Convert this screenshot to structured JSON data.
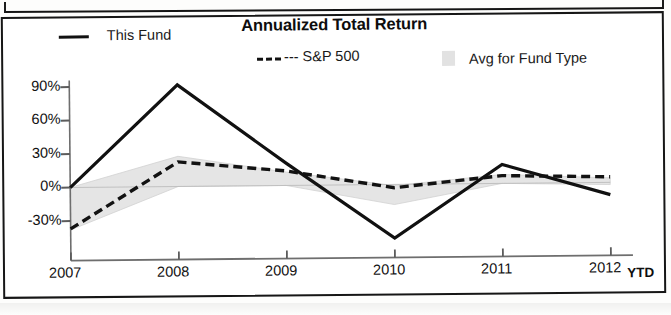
{
  "chart_data": {
    "type": "line",
    "title": "Annualized Total Return",
    "xlabel": "",
    "ylabel": "",
    "x_axis_suffix": "YTD",
    "categories": [
      "2007",
      "2008",
      "2009",
      "2010",
      "2011",
      "2012"
    ],
    "ytick_labels": [
      "90%",
      "60%",
      "30%",
      "0%",
      "-30%"
    ],
    "ytick_values": [
      90,
      60,
      30,
      0,
      -30
    ],
    "ylim": [
      -55,
      100
    ],
    "grid": false,
    "legend_position": "top",
    "series": [
      {
        "name": "This Fund",
        "style": "solid",
        "color": "#111111",
        "values": [
          0,
          91,
          20,
          -48,
          17,
          -11
        ]
      },
      {
        "name": "S&P 500",
        "style": "dashed",
        "color": "#111111",
        "values": [
          -37,
          22,
          13,
          -3,
          7,
          5
        ]
      },
      {
        "name": "Avg for Fund Type",
        "style": "band",
        "color": "#e3e3e3",
        "upper": [
          0,
          27,
          12,
          -1,
          8,
          4
        ],
        "lower": [
          -38,
          0,
          0,
          -18,
          0,
          -2
        ]
      }
    ]
  },
  "legend": {
    "fund_label": "This Fund",
    "sp_label": "--- S&P 500",
    "avg_label": "Avg for Fund Type"
  }
}
